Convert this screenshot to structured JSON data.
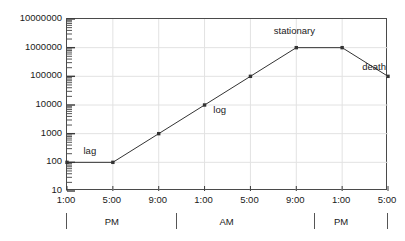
{
  "chart_data": {
    "type": "line",
    "title": "",
    "subtitle": "",
    "xlabel": "",
    "ylabel": "",
    "yscale": "log",
    "ylim": [
      10,
      10000000
    ],
    "grid": true,
    "legend_position": "none",
    "y_ticks": [
      {
        "value": 10,
        "label": "10"
      },
      {
        "value": 100,
        "label": "100"
      },
      {
        "value": 1000,
        "label": "1000"
      },
      {
        "value": 10000,
        "label": "10000"
      },
      {
        "value": 100000,
        "label": "100000"
      },
      {
        "value": 1000000,
        "label": "1000000"
      },
      {
        "value": 10000000,
        "label": "10000000"
      }
    ],
    "x_ticks": [
      {
        "index": 0,
        "label": "1:00"
      },
      {
        "index": 1,
        "label": "5:00"
      },
      {
        "index": 2,
        "label": "9:00"
      },
      {
        "index": 3,
        "label": "1:00"
      },
      {
        "index": 4,
        "label": "5:00"
      },
      {
        "index": 5,
        "label": "9:00"
      },
      {
        "index": 6,
        "label": "1:00"
      },
      {
        "index": 7,
        "label": "5:00"
      }
    ],
    "x_periods": [
      {
        "label": "PM",
        "start_index": 0,
        "end_index": 2
      },
      {
        "label": "AM",
        "start_index": 2,
        "end_index": 5
      },
      {
        "label": "PM",
        "start_index": 5,
        "end_index": 7
      }
    ],
    "period_dividers": [
      0,
      2.4,
      5.4,
      7
    ],
    "categories": [
      "1:00 PM",
      "5:00 PM",
      "9:00 PM",
      "1:00 AM",
      "5:00 AM",
      "9:00 AM",
      "1:00 PM",
      "5:00 PM"
    ],
    "series": [
      {
        "name": "bacterial growth",
        "color": "#333333",
        "marker": "square",
        "values": [
          100,
          100,
          1000,
          10000,
          100000,
          1000000,
          1000000,
          100000
        ]
      }
    ],
    "annotations": [
      {
        "text": "lag",
        "x_index": 0.52,
        "value": 230
      },
      {
        "text": "log",
        "x_index": 3.35,
        "value": 6200
      },
      {
        "text": "stationary",
        "x_index": 4.98,
        "value": 3400000
      },
      {
        "text": "death",
        "x_index": 6.72,
        "value": 200000
      }
    ]
  }
}
